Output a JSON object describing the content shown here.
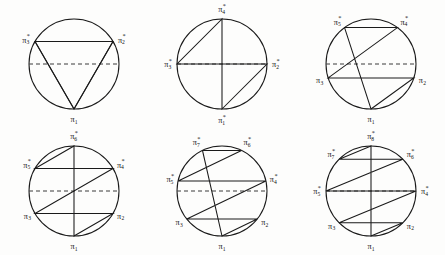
{
  "figure": {
    "background_color": "#fdfdfc",
    "stroke_color": "#1a1a1a",
    "dashed_color": "#3a3a3a",
    "columns": 3,
    "rows": 2
  },
  "notation": {
    "base_symbol": "π",
    "star_mark": "*",
    "description": "Vertices above the horizontal diameter carry a star superscript."
  },
  "panels": [
    {
      "id": "panel-triangle",
      "sides": 3,
      "shape_name": "triangle",
      "radius": 45,
      "has_dashed_diameter": true,
      "vertices": [
        {
          "index": 1,
          "label_base": "π",
          "sub": "1",
          "sup": "",
          "angle_deg": 270,
          "anchor": "middle",
          "dx": 0,
          "dy": 11
        },
        {
          "index": 2,
          "label_base": "π",
          "sub": "2",
          "sup": "*",
          "angle_deg": 30,
          "anchor": "start",
          "dx": 5,
          "dy": -1
        },
        {
          "index": 3,
          "label_base": "π",
          "sub": "3",
          "sup": "*",
          "angle_deg": 150,
          "anchor": "end",
          "dx": -5,
          "dy": -1
        }
      ]
    },
    {
      "id": "panel-square",
      "sides": 4,
      "shape_name": "square",
      "radius": 45,
      "has_dashed_diameter": true,
      "vertices": [
        {
          "index": 1,
          "label_base": "π",
          "sub": "1",
          "sup": "*",
          "angle_deg": 270,
          "anchor": "middle",
          "dx": 0,
          "dy": 12
        },
        {
          "index": 2,
          "label_base": "π",
          "sub": "2",
          "sup": "*",
          "angle_deg": 0,
          "anchor": "start",
          "dx": 5,
          "dy": 1
        },
        {
          "index": 3,
          "label_base": "π",
          "sub": "3",
          "sup": "*",
          "angle_deg": 180,
          "anchor": "end",
          "dx": -5,
          "dy": 1
        },
        {
          "index": 4,
          "label_base": "π",
          "sub": "4",
          "sup": "*",
          "angle_deg": 90,
          "anchor": "middle",
          "dx": 0,
          "dy": -9
        }
      ]
    },
    {
      "id": "panel-pentagon",
      "sides": 5,
      "shape_name": "pentagon",
      "radius": 45,
      "has_dashed_diameter": true,
      "vertices": [
        {
          "index": 1,
          "label_base": "π",
          "sub": "1",
          "sup": "",
          "angle_deg": 270,
          "anchor": "middle",
          "dx": 0,
          "dy": 11
        },
        {
          "index": 2,
          "label_base": "π",
          "sub": "2",
          "sup": "",
          "angle_deg": 342,
          "anchor": "start",
          "dx": 5,
          "dy": 3
        },
        {
          "index": 3,
          "label_base": "π",
          "sub": "3",
          "sup": "",
          "angle_deg": 198,
          "anchor": "end",
          "dx": -5,
          "dy": 3
        },
        {
          "index": 4,
          "label_base": "π",
          "sub": "4",
          "sup": "*",
          "angle_deg": 54,
          "anchor": "start",
          "dx": 3,
          "dy": -5
        },
        {
          "index": 5,
          "label_base": "π",
          "sub": "5",
          "sup": "*",
          "angle_deg": 126,
          "anchor": "end",
          "dx": -3,
          "dy": -5
        }
      ]
    },
    {
      "id": "panel-hexagon",
      "sides": 6,
      "shape_name": "hexagon",
      "radius": 45,
      "has_dashed_diameter": true,
      "vertices": [
        {
          "index": 1,
          "label_base": "π",
          "sub": "1",
          "sup": "",
          "angle_deg": 270,
          "anchor": "middle",
          "dx": 0,
          "dy": 11
        },
        {
          "index": 2,
          "label_base": "π",
          "sub": "2",
          "sup": "",
          "angle_deg": 330,
          "anchor": "start",
          "dx": 4,
          "dy": 3
        },
        {
          "index": 3,
          "label_base": "π",
          "sub": "3",
          "sup": "",
          "angle_deg": 210,
          "anchor": "end",
          "dx": -4,
          "dy": 3
        },
        {
          "index": 4,
          "label_base": "π",
          "sub": "4",
          "sup": "*",
          "angle_deg": 30,
          "anchor": "start",
          "dx": 4,
          "dy": -3
        },
        {
          "index": 5,
          "label_base": "π",
          "sub": "5",
          "sup": "*",
          "angle_deg": 150,
          "anchor": "end",
          "dx": -4,
          "dy": -3
        },
        {
          "index": 6,
          "label_base": "π",
          "sub": "6",
          "sup": "*",
          "angle_deg": 90,
          "anchor": "middle",
          "dx": 0,
          "dy": -9
        }
      ]
    },
    {
      "id": "panel-heptagon",
      "sides": 7,
      "shape_name": "heptagon",
      "radius": 45,
      "has_dashed_diameter": true,
      "vertices": [
        {
          "index": 1,
          "label_base": "π",
          "sub": "1",
          "sup": "",
          "angle_deg": 270,
          "anchor": "middle",
          "dx": 0,
          "dy": 11
        },
        {
          "index": 2,
          "label_base": "π",
          "sub": "2",
          "sup": "",
          "angle_deg": 321.4,
          "anchor": "start",
          "dx": 4,
          "dy": 4
        },
        {
          "index": 3,
          "label_base": "π",
          "sub": "3",
          "sup": "",
          "angle_deg": 218.6,
          "anchor": "end",
          "dx": -4,
          "dy": 4
        },
        {
          "index": 4,
          "label_base": "π",
          "sub": "4",
          "sup": "*",
          "angle_deg": 12.9,
          "anchor": "start",
          "dx": 4,
          "dy": -1
        },
        {
          "index": 5,
          "label_base": "π",
          "sub": "5",
          "sup": "*",
          "angle_deg": 167.1,
          "anchor": "end",
          "dx": -4,
          "dy": -1
        },
        {
          "index": 6,
          "label_base": "π",
          "sub": "6",
          "sup": "*",
          "angle_deg": 64.3,
          "anchor": "start",
          "dx": 2,
          "dy": -7
        },
        {
          "index": 7,
          "label_base": "π",
          "sub": "7",
          "sup": "*",
          "angle_deg": 115.7,
          "anchor": "end",
          "dx": -2,
          "dy": -7
        }
      ]
    },
    {
      "id": "panel-octagon",
      "sides": 8,
      "shape_name": "octagon",
      "radius": 45,
      "has_dashed_diameter": true,
      "vertices": [
        {
          "index": 1,
          "label_base": "π",
          "sub": "1",
          "sup": "",
          "angle_deg": 270,
          "anchor": "middle",
          "dx": 0,
          "dy": 11
        },
        {
          "index": 2,
          "label_base": "π",
          "sub": "2",
          "sup": "",
          "angle_deg": 315,
          "anchor": "start",
          "dx": 4,
          "dy": 4
        },
        {
          "index": 3,
          "label_base": "π",
          "sub": "3",
          "sup": "",
          "angle_deg": 225,
          "anchor": "end",
          "dx": -4,
          "dy": 4
        },
        {
          "index": 4,
          "label_base": "π",
          "sub": "4",
          "sup": "*",
          "angle_deg": 0,
          "anchor": "start",
          "dx": 5,
          "dy": 1
        },
        {
          "index": 5,
          "label_base": "π",
          "sub": "5",
          "sup": "*",
          "angle_deg": 180,
          "anchor": "end",
          "dx": -5,
          "dy": 1
        },
        {
          "index": 6,
          "label_base": "π",
          "sub": "6",
          "sup": "*",
          "angle_deg": 45,
          "anchor": "start",
          "dx": 4,
          "dy": -4
        },
        {
          "index": 7,
          "label_base": "π",
          "sub": "7",
          "sup": "*",
          "angle_deg": 135,
          "anchor": "end",
          "dx": -4,
          "dy": -4
        },
        {
          "index": 8,
          "label_base": "π",
          "sub": "8",
          "sup": "*",
          "angle_deg": 90,
          "anchor": "middle",
          "dx": 0,
          "dy": -9
        }
      ]
    }
  ]
}
